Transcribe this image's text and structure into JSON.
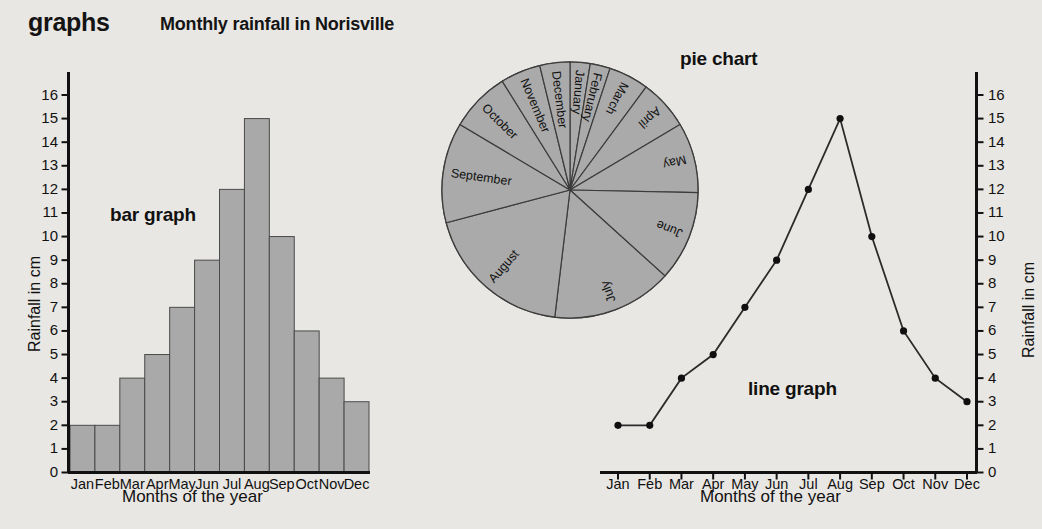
{
  "header": {
    "kicker": "graphs",
    "title": "Monthly rainfall in Norisville"
  },
  "labels": {
    "bar_graph": "bar graph",
    "pie_chart": "pie chart",
    "line_graph": "line graph",
    "y_axis_left": "Rainfall in cm",
    "y_axis_right": "Rainfall in cm",
    "x_axis_left": "Months of the year",
    "x_axis_right": "Months of the year"
  },
  "chart_data": [
    {
      "type": "bar",
      "title": "bar graph",
      "categories": [
        "Jan",
        "Feb",
        "Mar",
        "Apr",
        "May",
        "Jun",
        "Jul",
        "Aug",
        "Sep",
        "Oct",
        "Nov",
        "Dec"
      ],
      "values": [
        2,
        2,
        4,
        5,
        7,
        9,
        12,
        15,
        10,
        6,
        4,
        3
      ],
      "xlabel": "Months of the year",
      "ylabel": "Rainfall in cm",
      "ylim": [
        0,
        16
      ],
      "yticks": [
        0,
        1,
        2,
        3,
        4,
        5,
        6,
        7,
        8,
        9,
        10,
        11,
        12,
        13,
        14,
        15,
        16
      ],
      "grid": false,
      "bar_color": "#a9a9a9",
      "bar_edge_color": "#4a4a4a"
    },
    {
      "type": "pie",
      "title": "pie chart",
      "categories": [
        "January",
        "February",
        "March",
        "April",
        "May",
        "June",
        "July",
        "August",
        "September",
        "October",
        "November",
        "December"
      ],
      "values": [
        2,
        2,
        4,
        5,
        7,
        9,
        12,
        15,
        10,
        6,
        4,
        3
      ],
      "start_angle_deg": 0,
      "direction": "clockwise",
      "slice_color": "#aaaaaa",
      "slice_edge_color": "#3c3c3c",
      "legend": "labels-on-slices"
    },
    {
      "type": "line",
      "title": "line graph",
      "categories": [
        "Jan",
        "Feb",
        "Mar",
        "Apr",
        "May",
        "Jun",
        "Jul",
        "Aug",
        "Sep",
        "Oct",
        "Nov",
        "Dec"
      ],
      "values": [
        2,
        2,
        4,
        5,
        7,
        9,
        12,
        15,
        10,
        6,
        4,
        3
      ],
      "xlabel": "Months of the year",
      "ylabel": "Rainfall in cm",
      "ylim": [
        0,
        16
      ],
      "yticks": [
        0,
        1,
        2,
        3,
        4,
        5,
        6,
        7,
        8,
        9,
        10,
        11,
        12,
        13,
        14,
        15,
        16
      ],
      "grid": false,
      "line_color": "#2b2b2b",
      "marker": "circle",
      "marker_color": "#101010"
    }
  ],
  "colors": {
    "page_background": "#e9e7e3",
    "plot_background": "#eceae6",
    "ink": "#141414",
    "fill_gray": "#a9a9a9"
  }
}
